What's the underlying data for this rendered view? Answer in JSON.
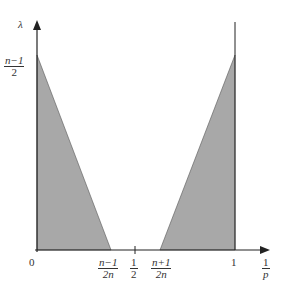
{
  "diagram": {
    "y_axis_label": "λ",
    "x_axis_label": {
      "num": "1",
      "den": "p"
    },
    "y_tick": {
      "num": "n−1",
      "den": "2"
    },
    "x_ticks": [
      {
        "label": "0"
      },
      {
        "num": "n−1",
        "den": "2n"
      },
      {
        "num": "1",
        "den": "2"
      },
      {
        "num": "n+1",
        "den": "2n"
      },
      {
        "label": "1"
      }
    ],
    "regions": [
      {
        "name": "left-triangle",
        "fill": "#a8a8a8"
      },
      {
        "name": "right-triangle",
        "fill": "#a8a8a8"
      }
    ]
  }
}
